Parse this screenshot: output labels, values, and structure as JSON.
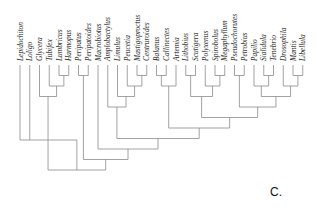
{
  "panel_label": "C.",
  "taxa": [
    "Lepidochiton",
    "Loligo",
    "Glycera",
    "Tubifex",
    "Lumbricus",
    "Harmopus",
    "Peripatus",
    "Peripatoides",
    "Macrobiotus",
    "Amplobactylus",
    "Limulus",
    "Peucetia",
    "Mastigoproctus",
    "Centruroides",
    "Balanus",
    "Callinectes",
    "Artemia",
    "Lithobius",
    "Scutigera",
    "Polyxenus",
    "Spirobolus",
    "Megaphyllum",
    "Pseudochorutes",
    "Petrobius",
    "Papilio",
    "Sialidula",
    "Tenebrio",
    "Drosophila",
    "Mantis",
    "Libellula"
  ],
  "tree": {
    "children": [
      "Lepidochiton",
      "Loligo",
      {
        "children": [
          {
            "children": [
              "Glycera",
              {
                "children": [
                  "Tubifex",
                  {
                    "children": [
                      "Lumbricus",
                      "Harmopus"
                    ]
                  }
                ]
              }
            ]
          },
          {
            "children": [
              {
                "children": [
                  "Peripatus",
                  "Peripatoides"
                ]
              },
              {
                "children": [
                  "Macrobiotus",
                  {
                    "children": [
                      {
                        "children": [
                          "Amplobactylus",
                          {
                            "children": [
                              "Limulus",
                              {
                                "children": [
                                  "Peucetia",
                                  {
                                    "children": [
                                      "Mastigoproctus",
                                      "Centruroides"
                                    ]
                                  }
                                ]
                              }
                            ]
                          }
                        ]
                      },
                      {
                        "children": [
                          {
                            "children": [
                              {
                                "children": [
                                  "Balanus",
                                  "Callinectes"
                                ]
                              },
                              "Artemia"
                            ]
                          },
                          {
                            "children": [
                              {
                                "children": [
                                  {
                                    "children": [
                                      "Lithobius",
                                      "Scutigera"
                                    ]
                                  },
                                  {
                                    "children": [
                                      "Polyxenus",
                                      {
                                        "children": [
                                          "Spirobolus",
                                          "Megaphyllum"
                                        ]
                                      }
                                    ]
                                  }
                                ]
                              },
                              {
                                "children": [
                                  {
                                    "children": [
                                      "Pseudochorutes",
                                      "Petrobius"
                                    ]
                                  },
                                  {
                                    "children": [
                                      {
                                        "children": [
                                          "Papilio",
                                          {
                                            "children": [
                                              "Sialidula",
                                              "Tenebrio"
                                            ]
                                          }
                                        ]
                                      },
                                      {
                                        "children": [
                                          "Drosophila",
                                          {
                                            "children": [
                                              "Mantis",
                                              "Libellula"
                                            ]
                                          }
                                        ]
                                      }
                                    ]
                                  }
                                ]
                              }
                            ]
                          }
                        ]
                      }
                    ]
                  }
                ]
              }
            ]
          }
        ]
      }
    ]
  }
}
